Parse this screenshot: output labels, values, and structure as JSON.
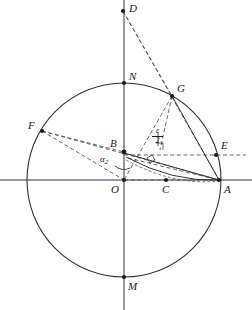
{
  "figure": {
    "kind": "geometric-construction",
    "width": 252,
    "height": 310,
    "background_color": "#ffffff",
    "stroke_color": "#333333",
    "dash_color": "#555555",
    "label_color": "#1a1a1a"
  },
  "axes": {
    "x_axis": {
      "name": "horizontal-axis",
      "x1": 0,
      "y1": 180,
      "x2": 252,
      "y2": 180
    },
    "y_axis": {
      "name": "vertical-axis",
      "x1": 124,
      "y1": 0,
      "x2": 124,
      "y2": 310
    }
  },
  "circle": {
    "center_x": 124,
    "center_y": 180,
    "radius": 97
  },
  "points": [
    {
      "id": "D",
      "label": "D",
      "x": 123,
      "y": 11,
      "label_dx": 6,
      "label_dy": -10,
      "on_circle": false
    },
    {
      "id": "N",
      "label": "N",
      "x": 124,
      "y": 83,
      "label_dx": 5,
      "label_dy": -14,
      "on_circle": true
    },
    {
      "id": "G",
      "label": "G",
      "x": 172,
      "y": 96,
      "label_dx": 5,
      "label_dy": -14,
      "on_circle": true
    },
    {
      "id": "F",
      "label": "F",
      "x": 42,
      "y": 131,
      "label_dx": -12,
      "label_dy": -12,
      "on_circle": true
    },
    {
      "id": "B",
      "label": "B",
      "x": 124,
      "y": 152,
      "label_dx": -13,
      "label_dy": -15,
      "on_circle": false
    },
    {
      "id": "E",
      "label": "E",
      "x": 216,
      "y": 155,
      "label_dx": 5,
      "label_dy": -15,
      "on_circle": true
    },
    {
      "id": "O",
      "label": "O",
      "x": 124,
      "y": 180,
      "label_dx": -13,
      "label_dy": 5,
      "on_circle": false
    },
    {
      "id": "C",
      "label": "C",
      "x": 166,
      "y": 180,
      "label_dx": -4,
      "label_dy": 5,
      "on_circle": false
    },
    {
      "id": "A",
      "label": "A",
      "x": 219,
      "y": 180,
      "label_dx": 5,
      "label_dy": 5,
      "on_circle": true
    },
    {
      "id": "M",
      "label": "M",
      "x": 124,
      "y": 277,
      "label_dx": 4,
      "label_dy": 5,
      "on_circle": true
    }
  ],
  "solid_segments": [
    {
      "name": "segment-N-to-M-on-axis",
      "from": "N",
      "to": "M"
    },
    {
      "name": "segment-B-to-A",
      "from": "B",
      "to": "A"
    },
    {
      "name": "segment-G-to-A",
      "from": "G",
      "to": "A"
    }
  ],
  "dashed_segments": [
    {
      "name": "dashed-D-to-A",
      "from": "D",
      "to": "A"
    },
    {
      "name": "dashed-D-to-G",
      "from": "D",
      "to": "G"
    },
    {
      "name": "dashed-G-to-O",
      "from": "G",
      "to": "O"
    },
    {
      "name": "dashed-G-to-C",
      "from": "G",
      "to": "C"
    },
    {
      "name": "dashed-F-to-B",
      "from": "F",
      "to": "B"
    },
    {
      "name": "dashed-F-to-O",
      "from": "F",
      "to": "O"
    },
    {
      "name": "dashed-F-to-A",
      "from": "F",
      "to": "A"
    },
    {
      "name": "dashed-B-to-E-horizontal",
      "from": "B",
      "to": "E"
    },
    {
      "name": "dashed-O-to-A-lower",
      "from": "O",
      "to": "A"
    }
  ],
  "arcs": [
    {
      "name": "arc-B-to-A-curve",
      "description": "curved arc sweeping from B down to A"
    },
    {
      "name": "arc-angle-alpha",
      "description": "small angle arc at O marking alpha"
    }
  ],
  "markers": [
    {
      "name": "right-angle-marker-at-C-perpendicular",
      "x": 151,
      "y": 160
    },
    {
      "name": "right-angle-marker-at-epsilon-foot",
      "x": 160,
      "y": 146
    }
  ],
  "annotations": {
    "alpha": {
      "name": "angle-alpha-label",
      "base": "α",
      "subscript": "2",
      "x": 104,
      "y": 159
    },
    "epsilon_over_two": {
      "name": "epsilon-over-two-label",
      "numerator": "ε",
      "denominator": "2",
      "x": 155,
      "y": 131
    }
  }
}
